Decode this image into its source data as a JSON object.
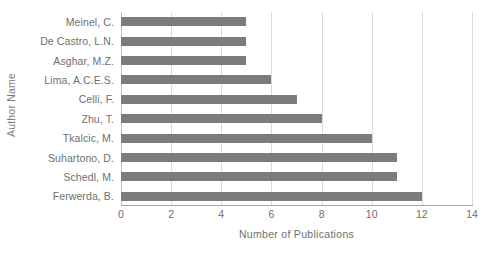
{
  "chart_data": {
    "type": "bar",
    "orientation": "horizontal",
    "title": "",
    "xlabel": "Number of Publications",
    "ylabel": "Author Name",
    "categories": [
      "Meinel, C.",
      "De Castro, L.N.",
      "Asghar, M.Z.",
      "Lima, A.C.E.S.",
      "Celli, F.",
      "Zhu, T.",
      "Tkalcic, M.",
      "Suhartono, D.",
      "Schedl, M.",
      "Ferwerda, B."
    ],
    "values": [
      5,
      5,
      5,
      6,
      7,
      8,
      10,
      11,
      11,
      12
    ],
    "xlim": [
      0,
      14
    ],
    "xticks": [
      0,
      2,
      4,
      6,
      8,
      10,
      12,
      14
    ],
    "xtick_labels": [
      "0",
      "2",
      "4",
      "6",
      "8",
      "10",
      "12",
      "14"
    ],
    "grid": "vertical",
    "legend": "none",
    "bar_color": "#7c7c7c",
    "gridline_color": "#d9d9d9",
    "text_color": "#6f6f6f",
    "background_color": "#ffffff"
  }
}
